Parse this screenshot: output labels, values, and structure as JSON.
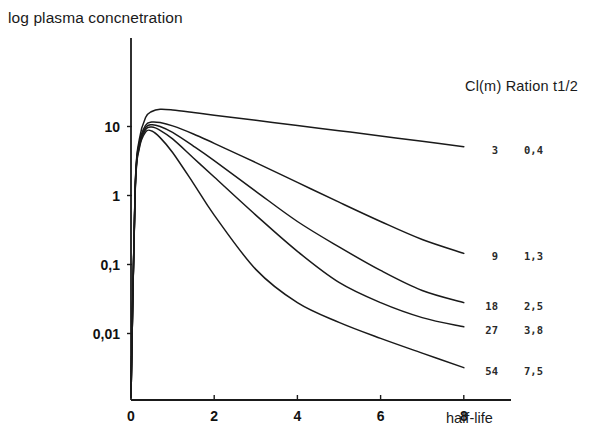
{
  "chart_data": {
    "type": "line",
    "title": "log plasma concnetration",
    "xlabel": "half-life",
    "ylabel": "log plasma concnetration",
    "yscale": "log",
    "xlim": [
      0,
      8.8
    ],
    "ylim": [
      0.001,
      40
    ],
    "grid": false,
    "legend_position": "right",
    "legend_header": "Cl(m) Ration t1/2",
    "legend_columns": [
      "Cl(m)",
      "Ration t1/2"
    ],
    "xticks": [
      "0",
      "2",
      "4",
      "6",
      "8"
    ],
    "xtick_values": [
      0,
      2,
      4,
      6,
      8
    ],
    "yticks": [
      "10",
      "1",
      "0,1",
      "0,01"
    ],
    "ytick_values": [
      10,
      1,
      0.1,
      0.01
    ],
    "series": [
      {
        "name": "3",
        "cl_m": "3",
        "ratio_t_half": "0,4",
        "x": [
          0,
          0.1,
          0.2,
          0.35,
          0.5,
          0.7,
          1.0,
          1.5,
          2.0,
          3.0,
          4.0,
          5.0,
          6.0,
          7.0,
          8.0
        ],
        "y": [
          0.0012,
          1.3,
          6.5,
          13.5,
          16.5,
          17.8,
          17.4,
          16.0,
          14.6,
          12.3,
          10.3,
          8.7,
          7.3,
          6.1,
          5.1
        ]
      },
      {
        "name": "9",
        "cl_m": "9",
        "ratio_t_half": "1,3",
        "x": [
          0,
          0.1,
          0.2,
          0.35,
          0.5,
          0.7,
          1.0,
          1.5,
          2.0,
          3.0,
          4.0,
          5.0,
          6.0,
          7.0,
          8.0
        ],
        "y": [
          0.0012,
          1.25,
          5.8,
          10.4,
          11.6,
          11.4,
          10.2,
          7.8,
          5.7,
          3.0,
          1.55,
          0.8,
          0.42,
          0.23,
          0.145
        ]
      },
      {
        "name": "18",
        "cl_m": "18",
        "ratio_t_half": "2,5",
        "x": [
          0,
          0.1,
          0.2,
          0.35,
          0.5,
          0.7,
          1.0,
          1.5,
          2.0,
          3.0,
          4.0,
          5.0,
          6.0,
          7.0,
          8.0
        ],
        "y": [
          0.0012,
          1.2,
          5.4,
          9.6,
          10.6,
          10.0,
          8.2,
          5.2,
          3.2,
          1.15,
          0.42,
          0.18,
          0.082,
          0.042,
          0.028
        ]
      },
      {
        "name": "27",
        "cl_m": "27",
        "ratio_t_half": "3,8",
        "x": [
          0,
          0.1,
          0.2,
          0.35,
          0.5,
          0.7,
          1.0,
          1.5,
          2.0,
          3.0,
          4.0,
          5.0,
          6.0,
          7.0,
          8.0
        ],
        "y": [
          0.0012,
          1.15,
          5.1,
          9.0,
          9.8,
          8.8,
          6.6,
          3.5,
          1.85,
          0.52,
          0.155,
          0.055,
          0.028,
          0.017,
          0.0125
        ]
      },
      {
        "name": "54",
        "cl_m": "54",
        "ratio_t_half": "7,5",
        "x": [
          0,
          0.1,
          0.2,
          0.35,
          0.5,
          0.7,
          1.0,
          1.5,
          2.0,
          3.0,
          4.0,
          5.0,
          6.0,
          7.0,
          8.0
        ],
        "y": [
          0.0012,
          1.1,
          4.8,
          8.3,
          8.6,
          6.9,
          4.2,
          1.5,
          0.52,
          0.085,
          0.028,
          0.0145,
          0.0085,
          0.0052,
          0.0032
        ]
      }
    ]
  },
  "legend": {
    "header": "Cl(m) Ration t1/2",
    "rows": [
      {
        "cl": "3",
        "ratio": "0,4"
      },
      {
        "cl": "9",
        "ratio": "1,3"
      },
      {
        "cl": "18",
        "ratio": "2,5"
      },
      {
        "cl": "27",
        "ratio": "3,8"
      },
      {
        "cl": "54",
        "ratio": "7,5"
      }
    ]
  },
  "axes": {
    "x_axis_title": "half-life",
    "y_axis_title": "log plasma concnetration",
    "x_ticks": [
      {
        "label": "0"
      },
      {
        "label": "2"
      },
      {
        "label": "4"
      },
      {
        "label": "6"
      },
      {
        "label": "8"
      }
    ],
    "y_ticks": [
      {
        "label": "10"
      },
      {
        "label": "1"
      },
      {
        "label": "0,1"
      },
      {
        "label": "0,01"
      }
    ]
  },
  "style": {
    "line_color": "#1a1a1a",
    "axis_color": "#1a1a1a",
    "background": "#ffffff"
  }
}
